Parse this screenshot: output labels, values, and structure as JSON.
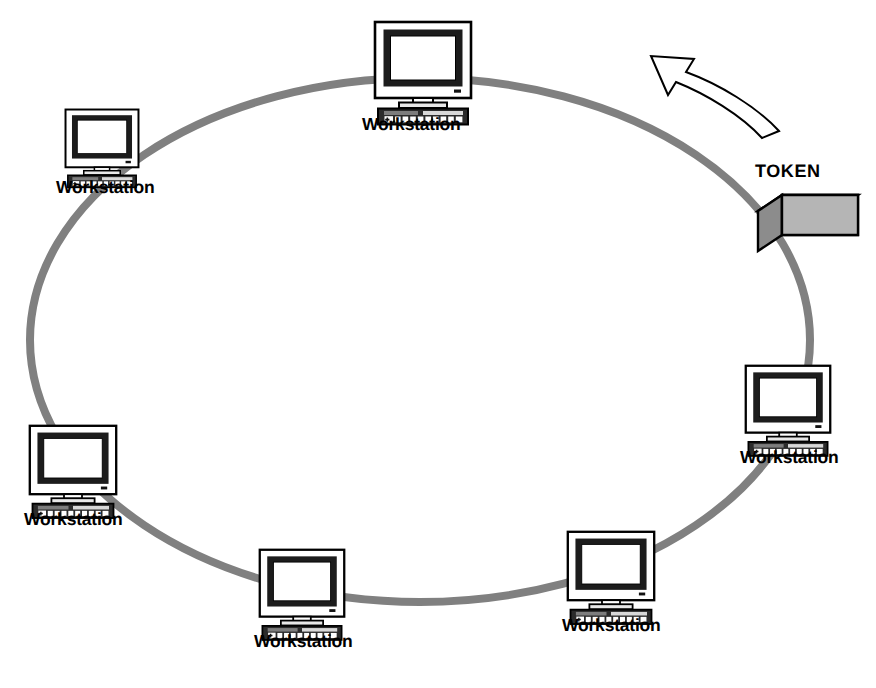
{
  "diagram": {
    "type": "network-topology",
    "topology": "ring",
    "background_color": "#ffffff",
    "ring": {
      "name": "token-ring-cable",
      "color": "#808080",
      "stroke_width": 8,
      "center_x": 420,
      "center_y": 340,
      "radius_x": 390,
      "radius_y": 262
    },
    "token": {
      "label": "TOKEN",
      "label_x": 755,
      "label_y": 162,
      "box": {
        "front_color": "#b5b5b5",
        "top_color": "#ffffff",
        "side_color": "#8c8c8c",
        "outline_color": "#000000",
        "x": 758,
        "y": 195,
        "width": 100,
        "height": 56
      }
    },
    "direction_arrow": {
      "name": "counterclockwise-flow-arrow",
      "fill": "#ffffff",
      "stroke": "#000000",
      "direction": "counterclockwise",
      "points_toward": "upper-left"
    },
    "node_icon": {
      "name": "workstation-computer-icon",
      "monitor_bezel_color": "#ffffff",
      "screen_border_color": "#1a1a1a",
      "screen_color": "#ffffff",
      "keyboard_color": "#2b2b2b",
      "key_color": "#ffffff",
      "outline_color": "#000000"
    },
    "nodes": [
      {
        "id": "workstation-top",
        "label": "Workstation",
        "x": 373,
        "y": 20,
        "scale": 1.0,
        "label_x": 362,
        "label_y": 116
      },
      {
        "id": "workstation-upper-left",
        "label": "Workstation",
        "x": 64,
        "y": 108,
        "scale": 0.76,
        "label_x": 56,
        "label_y": 179
      },
      {
        "id": "workstation-left",
        "label": "Workstation",
        "x": 28,
        "y": 424,
        "scale": 0.9,
        "label_x": 24,
        "label_y": 511
      },
      {
        "id": "workstation-bottom-left",
        "label": "Workstation",
        "x": 258,
        "y": 548,
        "scale": 0.88,
        "label_x": 254,
        "label_y": 633
      },
      {
        "id": "workstation-bottom-right",
        "label": "Workstation",
        "x": 566,
        "y": 530,
        "scale": 0.9,
        "label_x": 562,
        "label_y": 617
      },
      {
        "id": "workstation-right",
        "label": "Workstation",
        "x": 744,
        "y": 364,
        "scale": 0.88,
        "label_x": 740,
        "label_y": 449
      }
    ]
  },
  "chart_data": {
    "type": "diagram",
    "node_count": 6,
    "node_labels": [
      "Workstation",
      "Workstation",
      "Workstation",
      "Workstation",
      "Workstation",
      "Workstation"
    ],
    "annotations": [
      "TOKEN"
    ],
    "flow_direction": "counterclockwise"
  }
}
